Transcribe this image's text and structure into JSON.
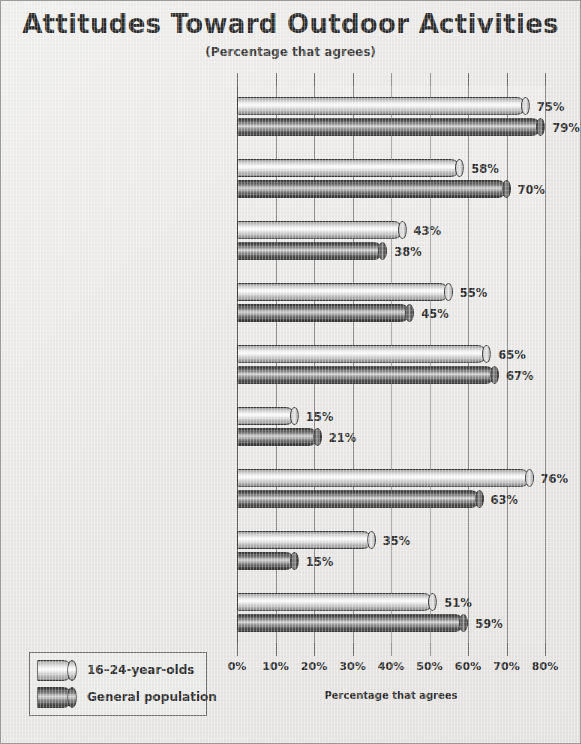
{
  "chart_data": {
    "type": "bar",
    "orientation": "horizontal",
    "title": "Attitudes Toward Outdoor Activities",
    "subtitle": "(Percentage that agrees)",
    "xlabel": "Percentage that agrees",
    "ylabel": "",
    "xlim": [
      0,
      80
    ],
    "xticks": [
      0,
      10,
      20,
      30,
      40,
      50,
      60,
      70,
      80
    ],
    "xtick_labels": [
      "0%",
      "10%",
      "20%",
      "30%",
      "40%",
      "50%",
      "60%",
      "70%",
      "80%"
    ],
    "grid": true,
    "legend_position": "bottom-left",
    "categories": [
      "I take charge of my own health.",
      "I was more active in the past than I am now.",
      "I have too many other commitments to consider outdoor activities.",
      "I think watching TV together is a great way to build family relationships.",
      "I've been participating in family activities for as long as I can remember.",
      "My idea of \"roughing it\" is spending a night in a cheap hotel.",
      "I like activities that are physically challenging.",
      "I engage in activities that are considered \"extreme.\"",
      "I only participate in  outdoor activities when the weather cooperates."
    ],
    "category_lines": [
      [
        "I take charge of my own health."
      ],
      [
        "I was more active in the",
        "past than I am now."
      ],
      [
        "I have too many other",
        "commitments to consider",
        "outdoor activities."
      ],
      [
        "I think watching TV together",
        "is a great way to build",
        "family relationships."
      ],
      [
        "I've been participating in",
        "family activities for as",
        "long as I can remember."
      ],
      [
        "My idea of \"roughing it\" is",
        "spending a night in a cheap hotel."
      ],
      [
        "I like activities that are",
        "physically challenging."
      ],
      [
        "I engage in activities that",
        "are considered \"extreme.\""
      ],
      [
        "I only participate in  outdoor",
        "activities when the weather",
        "cooperates."
      ]
    ],
    "series": [
      {
        "name": "16–24-year-olds",
        "color": "#e0e0e0",
        "values": [
          75,
          58,
          43,
          55,
          65,
          15,
          76,
          35,
          51
        ],
        "value_labels": [
          "75%",
          "58%",
          "43%",
          "55%",
          "65%",
          "15%",
          "76%",
          "35%",
          "51%"
        ]
      },
      {
        "name": "General population",
        "color": "#3a3a3a",
        "values": [
          79,
          70,
          38,
          45,
          67,
          21,
          63,
          15,
          59
        ],
        "value_labels": [
          "79%",
          "70%",
          "38%",
          "45%",
          "67%",
          "21%",
          "63%",
          "15%",
          "59%"
        ]
      }
    ]
  },
  "legend": {
    "items": [
      {
        "label": "16–24-year-olds"
      },
      {
        "label": "General population"
      }
    ]
  }
}
